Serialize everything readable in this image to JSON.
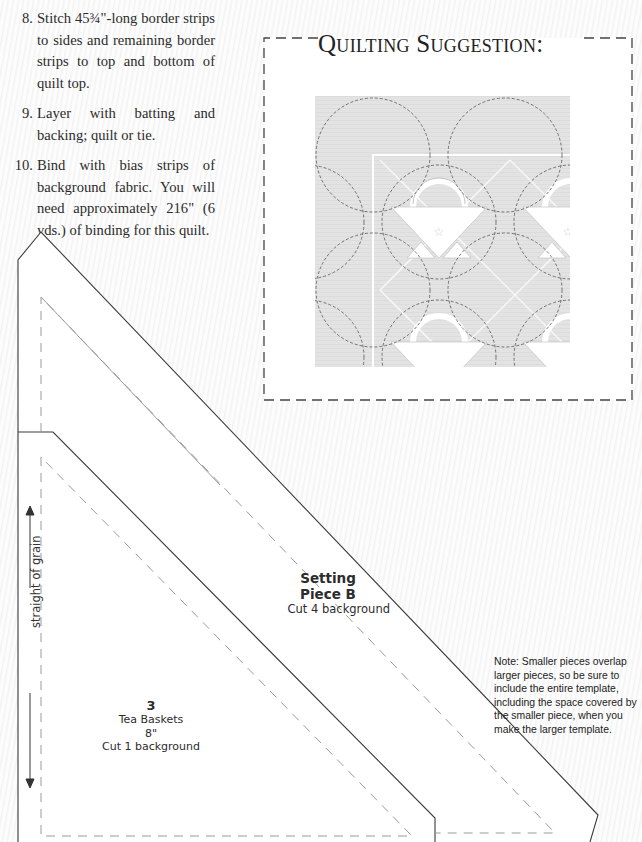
{
  "instructions": {
    "steps": [
      {
        "number": "8.",
        "text": "Stitch 45¾\"-long border strips to sides and remaining border strips to top and bottom of quilt top."
      },
      {
        "number": "9.",
        "text": "Layer with batting and backing; quilt or tie."
      },
      {
        "number": "10.",
        "text": "Bind with bias strips of background fabric. You will need approximately  216\" (6 yds.) of binding for this quilt."
      }
    ]
  },
  "quilting_suggestion": {
    "title": "Quilting Suggestion:"
  },
  "templates": {
    "setting_piece_b": {
      "title_line1": "Setting",
      "title_line2": "Piece B",
      "cut": "Cut 4 background"
    },
    "piece_3": {
      "number": "3",
      "pattern": "Tea Baskets",
      "size": "8\"",
      "cut": "Cut 1 background"
    },
    "grain_label": "straight of grain"
  },
  "note": {
    "text": "Note: Smaller pieces overlap larger pieces, so be sure to include the entire template, including the space covered by the smaller piece, when you make the larger template."
  },
  "colors": {
    "text": "#2b2b2b",
    "solid_line": "#3a3a3a",
    "dashed_line": "#9a9a9a",
    "quilt_bg": "#e2e2e2"
  }
}
